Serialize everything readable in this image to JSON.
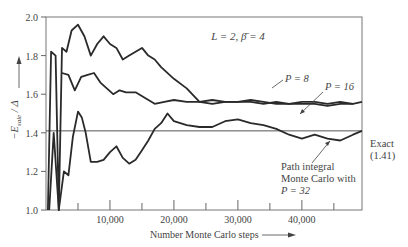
{
  "chart_data": {
    "type": "line",
    "title": "",
    "annotation_params": "L = 2,  β̄ = 4",
    "xlabel": "Number Monte Carlo steps",
    "ylabel": "−E_sale / Δ",
    "xlim": [
      0,
      49400
    ],
    "ylim": [
      1.0,
      2.0
    ],
    "xticks": [
      10000,
      20000,
      30000,
      40000
    ],
    "xtick_labels": [
      "10,000",
      "20,000",
      "30,000",
      "40,000"
    ],
    "xminor_ticks": [
      5000,
      15000,
      25000,
      35000,
      45000
    ],
    "yticks": [
      1.0,
      1.2,
      1.4,
      1.6,
      1.8,
      2.0
    ],
    "ytick_labels": [
      "1.0",
      "1.2",
      "1.4",
      "1.6",
      "1.8",
      "2.0"
    ],
    "grid": false,
    "reference_line": {
      "y": 1.41,
      "label": "Exact",
      "value_label": "(1.41)"
    },
    "series": [
      {
        "name": "P = 8",
        "x": [
          300,
          800,
          1500,
          2000,
          2500,
          3200,
          4000,
          5000,
          6000,
          7000,
          8000,
          9000,
          10000,
          11000,
          12000,
          13000,
          14000,
          15000,
          16000,
          17000,
          18000,
          20000,
          22000,
          24000,
          26000,
          28000,
          30000,
          32000,
          34000,
          36000,
          38000,
          40000,
          42000,
          44000,
          46000,
          48000,
          49400
        ],
        "values": [
          1.0,
          1.82,
          1.8,
          1.0,
          1.84,
          1.82,
          1.93,
          1.96,
          1.9,
          1.8,
          1.86,
          1.9,
          1.86,
          1.84,
          1.78,
          1.8,
          1.82,
          1.84,
          1.8,
          1.78,
          1.74,
          1.68,
          1.63,
          1.56,
          1.55,
          1.56,
          1.56,
          1.56,
          1.55,
          1.56,
          1.55,
          1.56,
          1.56,
          1.55,
          1.56,
          1.55,
          1.56
        ]
      },
      {
        "name": "P = 16",
        "x": [
          2500,
          3500,
          4500,
          5500,
          6500,
          7500,
          8500,
          9500,
          10500,
          11500,
          12500,
          14000,
          15500,
          17000,
          18500,
          20000,
          22000,
          24000,
          26000,
          28000,
          30000,
          32000,
          34000,
          36000,
          38000,
          40000,
          42000,
          44000,
          46000,
          48000
        ],
        "values": [
          1.71,
          1.7,
          1.62,
          1.69,
          1.7,
          1.71,
          1.66,
          1.63,
          1.6,
          1.62,
          1.61,
          1.61,
          1.58,
          1.55,
          1.56,
          1.57,
          1.56,
          1.56,
          1.57,
          1.56,
          1.56,
          1.57,
          1.56,
          1.55,
          1.55,
          1.55,
          1.55,
          1.54,
          1.55,
          1.55
        ]
      },
      {
        "name": "Path integral Monte Carlo with P = 32",
        "x": [
          500,
          1200,
          2000,
          2800,
          3500,
          4200,
          5000,
          5600,
          6200,
          7000,
          8000,
          9000,
          10000,
          11000,
          12000,
          13000,
          14000,
          15000,
          16000,
          17000,
          18000,
          19000,
          20000,
          22000,
          24000,
          26000,
          28000,
          30000,
          32000,
          34000,
          36000,
          38000,
          40000,
          42000,
          44000,
          46000,
          48000,
          49400
        ],
        "values": [
          1.0,
          1.4,
          1.0,
          1.2,
          1.18,
          1.38,
          1.51,
          1.48,
          1.4,
          1.25,
          1.25,
          1.26,
          1.3,
          1.33,
          1.27,
          1.24,
          1.26,
          1.31,
          1.36,
          1.42,
          1.45,
          1.5,
          1.46,
          1.44,
          1.43,
          1.43,
          1.46,
          1.47,
          1.45,
          1.44,
          1.42,
          1.39,
          1.37,
          1.39,
          1.37,
          1.36,
          1.39,
          1.41
        ]
      }
    ],
    "series_labels": [
      {
        "text": "P = 8",
        "target_series": 0
      },
      {
        "text": "P = 16",
        "target_series": 1
      },
      {
        "text_lines": [
          "Path integral",
          "Monte Carlo with",
          "P = 32"
        ],
        "target_series": 2
      }
    ]
  },
  "labels": {
    "params": "L = 2,  β̄ = 4",
    "p8": "P = 8",
    "p16": "P = 16",
    "exact": "Exact",
    "exact_value": "(1.41)",
    "pimc_line1": "Path integral",
    "pimc_line2": "Monte Carlo with",
    "pimc_line3": "P = 32",
    "xlabel": "Number Monte Carlo steps",
    "ylabel": "−E",
    "ylabel_sub": "sale",
    "ylabel_tail": " / Δ"
  }
}
